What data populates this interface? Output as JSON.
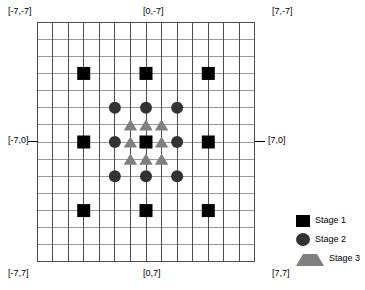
{
  "figure": {
    "title": "",
    "grid": {
      "cols": 14,
      "rows": 14,
      "x_min": -7,
      "x_max": 7,
      "y_min": -7,
      "y_max": 7,
      "vertical_line_color": "#4d4d4d",
      "horizontal_line_color": "#9a9a9a",
      "border_color": "#4d4d4d",
      "background": "#ffffff"
    },
    "corner_labels": {
      "top_left": "[-7,-7]",
      "top_center": "[0,-7]",
      "top_right": "[7,-7]",
      "middle_left": "[-7,0]",
      "middle_right": "[7,0]",
      "bottom_left": "[-7,7]",
      "bottom_center": "[0,7]",
      "bottom_right": "[7,7]"
    }
  },
  "legend": {
    "position": "bottom-right",
    "items": [
      {
        "label": "Stage 1",
        "marker": "square",
        "color": "#000000"
      },
      {
        "label": "Stage 2",
        "marker": "circle",
        "color": "#333333"
      },
      {
        "label": "Stage 3",
        "marker": "triangle",
        "color": "#808080"
      }
    ]
  },
  "chart_data": {
    "type": "scatter",
    "title": "",
    "xlabel": "",
    "ylabel": "",
    "xlim": [
      -7,
      7
    ],
    "ylim": [
      -7,
      7
    ],
    "grid": true,
    "y_axis_inverted": true,
    "legend_position": "bottom-right",
    "series": [
      {
        "name": "Stage 1",
        "marker": "square",
        "color": "#000000",
        "size": 13,
        "points": [
          [
            -4,
            -4
          ],
          [
            0,
            -4
          ],
          [
            4,
            -4
          ],
          [
            -4,
            0
          ],
          [
            0,
            0
          ],
          [
            4,
            0
          ],
          [
            -4,
            4
          ],
          [
            0,
            4
          ],
          [
            4,
            4
          ]
        ]
      },
      {
        "name": "Stage 2",
        "marker": "circle",
        "color": "#333333",
        "size": 12,
        "points": [
          [
            -2,
            -2
          ],
          [
            0,
            -2
          ],
          [
            2,
            -2
          ],
          [
            -2,
            0
          ],
          [
            2,
            0
          ],
          [
            -2,
            2
          ],
          [
            0,
            2
          ],
          [
            2,
            2
          ]
        ]
      },
      {
        "name": "Stage 3",
        "marker": "triangle",
        "color": "#808080",
        "size": 12,
        "points": [
          [
            -1,
            -1
          ],
          [
            0,
            -1
          ],
          [
            1,
            -1
          ],
          [
            -1,
            0
          ],
          [
            1,
            0
          ],
          [
            -1,
            1
          ],
          [
            0,
            1
          ],
          [
            1,
            1
          ]
        ]
      }
    ]
  }
}
